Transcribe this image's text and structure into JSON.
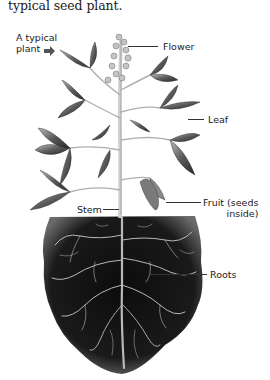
{
  "caption": "typical seed plant.",
  "diagram": {
    "intro_label_line1": "A typical",
    "intro_label_line2": "plant",
    "intro_icon": "arrow-right-icon",
    "labels": {
      "flower": "Flower",
      "leaf": "Leaf",
      "stem": "Stem",
      "fruit_line1": "Fruit (seeds",
      "fruit_line2": "inside)",
      "roots": "Roots"
    },
    "colors": {
      "soil": "#111111",
      "leaf_dark": "#3a3a3a",
      "leaf_light": "#9a9a9a",
      "stem": "#d8d8d8",
      "root": "#bdbdbd"
    }
  }
}
